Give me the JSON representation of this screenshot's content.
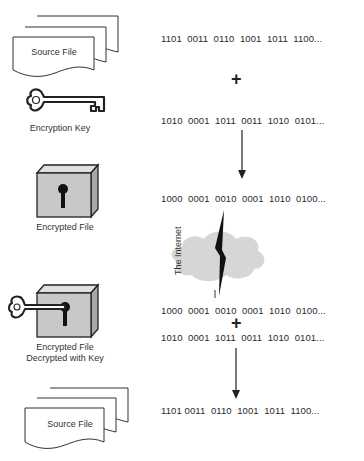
{
  "steps": {
    "source_file_top": {
      "label": "Source File",
      "bits": "1101  0011  0110  1001  1011  1100..."
    },
    "operator_1": "+",
    "encryption_key": {
      "label": "Encryption Key",
      "bits": "1010  0001  1011  0011  1010  0101..."
    },
    "encrypted_file": {
      "label": "Encrypted File",
      "bits": "1000  0001  0010  0001  1010  0100..."
    },
    "internet": {
      "label": "The Internet"
    },
    "decrypted": {
      "label_line1": "Encrypted File",
      "label_line2": "Decrypted with Key",
      "bits_cipher": "1000  0001  0010  0001  1010  0100...",
      "operator": "+",
      "bits_key": "1010  0001  1011  0011  1010  0101..."
    },
    "source_file_bottom": {
      "label": "Source File",
      "bits": "1101 0011  0110  1001  1011  1100..."
    }
  },
  "colors": {
    "box_fill": "#c8c8c8",
    "box_top": "#e0e0e0",
    "box_side": "#a8a8a8",
    "cloud": "#d6d6d6",
    "stroke": "#222222"
  }
}
